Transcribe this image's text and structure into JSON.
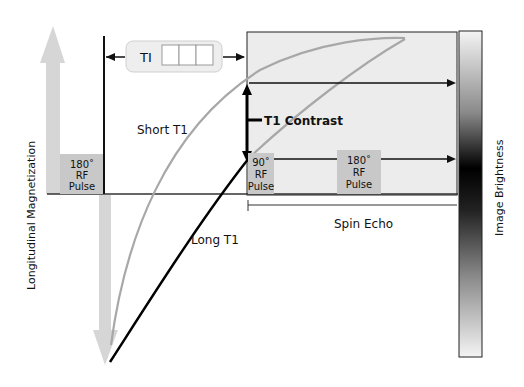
{
  "diagram": {
    "y_axis_label": "Longitudinal Magnetization",
    "right_axis_label": "Image Brightness",
    "ti_label": "TI",
    "ti_boxes": 3,
    "short_t1_label": "Short T1",
    "long_t1_label": "Long T1",
    "t1_contrast_label": "T1 Contrast",
    "pulse_180_initial": {
      "line1": "180˚",
      "line2": "RF",
      "line3": "Pulse"
    },
    "pulse_90": {
      "line1": "90˚",
      "line2": "RF",
      "line3": "Pulse"
    },
    "pulse_180_echo": {
      "line1": "180˚",
      "line2": "RF",
      "line3": "Pulse"
    },
    "spin_echo_label": "Spin Echo",
    "colors": {
      "short_t1_curve": "#a8a8a8",
      "long_t1_curve": "#000000",
      "pulse_box": "#c8c8c8",
      "arrow_fill": "#d6d6d6",
      "panel_fill": "#ececec",
      "ti_box_fill": "#eeeeee"
    }
  }
}
